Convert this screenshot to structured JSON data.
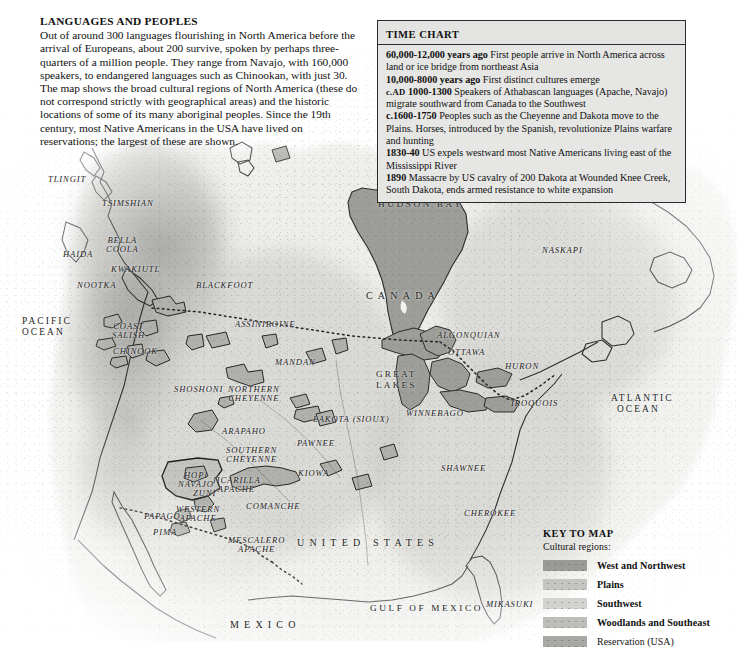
{
  "intro": {
    "heading": "LANGUAGES AND PEOPLES",
    "body": "Out of around 300 languages flourishing in North America before the arrival of Europeans, about 200 survive, spoken by perhaps three-quarters of a million people. They range from Navajo, with 160,000 speakers, to endangered languages such as Chinookan, with just 30. The map shows the broad cultural regions of North America (these do not correspond strictly with geographical areas) and the historic locations of some of its many aboriginal peoples. Since the 19th century, most Native Americans in the USA have lived on reservations; the largest of these are shown."
  },
  "time_chart": {
    "title": "TIME CHART",
    "entries": [
      {
        "era": "60,000-12,000 years ago",
        "era_smallcaps": "",
        "text": "First people arrive in North America across land or ice bridge from northeast Asia"
      },
      {
        "era": "10,000-8000 years ago",
        "era_smallcaps": "",
        "text": "First distinct cultures emerge"
      },
      {
        "era": "1000-1300",
        "era_smallcaps": "c.AD",
        "text": "Speakers of Athabascan languages (Apache, Navajo) migrate southward from Canada to the Southwest"
      },
      {
        "era": "c.1600-1750",
        "era_smallcaps": "",
        "text": "Peoples such as the Cheyenne and Dakota move to the Plains. Horses, introduced by the Spanish, revolutionize Plains warfare and hunting"
      },
      {
        "era": "1830-40",
        "era_smallcaps": "",
        "text": "US expels westward most Native Americans living east of the Mississippi River"
      },
      {
        "era": "1890",
        "era_smallcaps": "",
        "text": "Massacre by US cavalry of 200 Dakota at Wounded Knee Creek, South Dakota, ends armed resistance to white expansion"
      }
    ]
  },
  "key": {
    "title": "KEY TO MAP",
    "subtitle": "Cultural regions:",
    "entries": [
      {
        "label": "West and Northwest",
        "color": "#9a9a96"
      },
      {
        "label": "Plains",
        "color": "#c4c4c0"
      },
      {
        "label": "Southwest",
        "color": "#d2d2ce"
      },
      {
        "label": "Woodlands and Southeast",
        "color": "#bdbdb9"
      },
      {
        "label": "Reservation (USA)",
        "color": "#a8a8a4"
      }
    ]
  },
  "map": {
    "colors": {
      "land": "#ededea",
      "water": "#ffffff",
      "sea_fill": "#9d9d99",
      "region_west": "#9e9e9a",
      "region_plains": "#d9d9d5",
      "region_southwest": "#e2e2de",
      "region_woodlands": "#cdcdc9",
      "reservation": "#b3b3af",
      "coastline": "#2b2b2b",
      "border_dotted": "#262626",
      "label": "#1d1d1d"
    },
    "oceans": [
      {
        "name": "PACIFIC OCEAN",
        "lines": [
          "PACIFIC",
          "OCEAN"
        ],
        "x": 22,
        "y": 316
      },
      {
        "name": "ATLANTIC OCEAN",
        "lines": [
          "ATLANTIC",
          "OCEAN"
        ],
        "x": 611,
        "y": 393
      }
    ],
    "seas": [
      {
        "name": "HUDSON BAY",
        "x": 378,
        "y": 200
      },
      {
        "name": "GULF OF MEXICO",
        "x": 370,
        "y": 604
      }
    ],
    "lakes": [
      {
        "name": "GREAT LAKES",
        "lines": [
          "GREAT",
          "LAKES"
        ],
        "x": 376,
        "y": 369
      }
    ],
    "countries": [
      {
        "name": "CANADA",
        "x": 366,
        "y": 291
      },
      {
        "name": "UNITED STATES",
        "x": 297,
        "y": 538
      },
      {
        "name": "MEXICO",
        "x": 230,
        "y": 620
      }
    ],
    "peoples": [
      {
        "name": "TLINGIT",
        "lines": [
          "TLINGIT"
        ],
        "x": 48,
        "y": 175
      },
      {
        "name": "TSIMSHIAN",
        "lines": [
          "TSIMSHIAN"
        ],
        "x": 102,
        "y": 199
      },
      {
        "name": "HAIDA",
        "lines": [
          "HAIDA"
        ],
        "x": 63,
        "y": 250
      },
      {
        "name": "BELLA COOLA",
        "lines": [
          "BELLA",
          "COOLA"
        ],
        "x": 106,
        "y": 236
      },
      {
        "name": "KWAKIUTL",
        "lines": [
          "KWAKIUTL"
        ],
        "x": 111,
        "y": 265
      },
      {
        "name": "NOOTKA",
        "lines": [
          "NOOTKA"
        ],
        "x": 77,
        "y": 281
      },
      {
        "name": "COAST SALISH",
        "lines": [
          "COAST",
          "SALISH"
        ],
        "x": 112,
        "y": 322
      },
      {
        "name": "CHINOOK",
        "lines": [
          "CHINOOK"
        ],
        "x": 113,
        "y": 347
      },
      {
        "name": "BLACKFOOT",
        "lines": [
          "BLACKFOOT"
        ],
        "x": 196,
        "y": 281
      },
      {
        "name": "ASSINIBOINE",
        "lines": [
          "ASSINIBOINE"
        ],
        "x": 235,
        "y": 320
      },
      {
        "name": "MANDAN",
        "lines": [
          "MANDAN"
        ],
        "x": 275,
        "y": 358
      },
      {
        "name": "SHOSHONI",
        "lines": [
          "SHOSHONI"
        ],
        "x": 174,
        "y": 385
      },
      {
        "name": "NORTHERN CHEYENNE",
        "lines": [
          "NORTHERN",
          "CHEYENNE"
        ],
        "x": 228,
        "y": 385
      },
      {
        "name": "LAKOTA (SIOUX)",
        "lines": [
          "LAKOTA (SIOUX)"
        ],
        "x": 313,
        "y": 415
      },
      {
        "name": "ARAPAHO",
        "lines": [
          "ARAPAHO"
        ],
        "x": 222,
        "y": 427
      },
      {
        "name": "SOUTHERN CHEYENNE",
        "lines": [
          "SOUTHERN",
          "CHEYENNE"
        ],
        "x": 226,
        "y": 446
      },
      {
        "name": "PAWNEE",
        "lines": [
          "PAWNEE"
        ],
        "x": 297,
        "y": 439
      },
      {
        "name": "KIOWA",
        "lines": [
          "KIOWA"
        ],
        "x": 298,
        "y": 469
      },
      {
        "name": "HOPI",
        "lines": [
          "HOPI"
        ],
        "x": 184,
        "y": 471
      },
      {
        "name": "NAVAJO",
        "lines": [
          "NAVAJO"
        ],
        "x": 178,
        "y": 480
      },
      {
        "name": "ZUNI",
        "lines": [
          "ZUNI"
        ],
        "x": 193,
        "y": 489
      },
      {
        "name": "JICARILLA APACHE",
        "lines": [
          "JICARILLA",
          "APACHE"
        ],
        "x": 212,
        "y": 476
      },
      {
        "name": "COMANCHE",
        "lines": [
          "COMANCHE"
        ],
        "x": 246,
        "y": 502
      },
      {
        "name": "PAPAGO",
        "lines": [
          "PAPAGO"
        ],
        "x": 144,
        "y": 512
      },
      {
        "name": "WESTERN APACHE",
        "lines": [
          "WESTERN",
          "APACHE"
        ],
        "x": 176,
        "y": 505
      },
      {
        "name": "PIMA",
        "lines": [
          "PIMA"
        ],
        "x": 153,
        "y": 528
      },
      {
        "name": "MESCALERO APACHE",
        "lines": [
          "MESCALERO",
          "APACHE"
        ],
        "x": 228,
        "y": 536
      },
      {
        "name": "ALGONQUIAN",
        "lines": [
          "ALGONQUIAN"
        ],
        "x": 437,
        "y": 331
      },
      {
        "name": "OTTAWA",
        "lines": [
          "OTTAWA"
        ],
        "x": 448,
        "y": 348
      },
      {
        "name": "HURON",
        "lines": [
          "HURON"
        ],
        "x": 505,
        "y": 362
      },
      {
        "name": "IROQUOIS",
        "lines": [
          "IROQUOIS"
        ],
        "x": 511,
        "y": 399
      },
      {
        "name": "WINNEBAGO",
        "lines": [
          "WINNEBAGO"
        ],
        "x": 406,
        "y": 409
      },
      {
        "name": "NASKAPI",
        "lines": [
          "NASKAPI"
        ],
        "x": 542,
        "y": 246
      },
      {
        "name": "SHAWNEE",
        "lines": [
          "SHAWNEE"
        ],
        "x": 441,
        "y": 464
      },
      {
        "name": "CHEROKEE",
        "lines": [
          "CHEROKEE"
        ],
        "x": 464,
        "y": 509
      },
      {
        "name": "MIKASUKI",
        "lines": [
          "MIKASUKI"
        ],
        "x": 486,
        "y": 600
      }
    ]
  }
}
